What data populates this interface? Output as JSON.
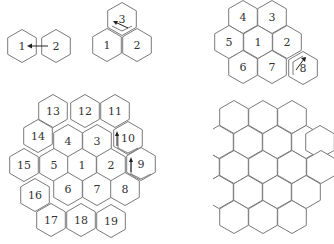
{
  "panels": [
    {
      "id": "panel-a",
      "hexes": [
        {
          "label": "1",
          "cx": 22,
          "cy": 46
        },
        {
          "label": "2",
          "cx": 56,
          "cy": 46
        }
      ],
      "arrow": {
        "from": "2",
        "to": "1"
      }
    },
    {
      "id": "panel-b",
      "hexes": [
        {
          "label": "3",
          "cx": 122,
          "cy": 19
        },
        {
          "label": "1",
          "cx": 107,
          "cy": 45
        },
        {
          "label": "2",
          "cx": 137,
          "cy": 45
        }
      ],
      "arrow": {
        "from": "3",
        "to": "1"
      }
    },
    {
      "id": "panel-c",
      "hexes": [
        {
          "label": "4",
          "cx": 243,
          "cy": 17
        },
        {
          "label": "3",
          "cx": 272,
          "cy": 17
        },
        {
          "label": "5",
          "cx": 229,
          "cy": 42
        },
        {
          "label": "1",
          "cx": 258,
          "cy": 42
        },
        {
          "label": "2",
          "cx": 287,
          "cy": 42
        },
        {
          "label": "6",
          "cx": 243,
          "cy": 67
        },
        {
          "label": "7",
          "cx": 272,
          "cy": 67
        },
        {
          "label": "8",
          "cx": 303,
          "cy": 68
        }
      ],
      "arrow": {
        "from": "8",
        "to": "7"
      }
    },
    {
      "id": "panel-d",
      "hexes": [
        {
          "label": "13",
          "cx": 53,
          "cy": 111
        },
        {
          "label": "12",
          "cx": 85,
          "cy": 111
        },
        {
          "label": "11",
          "cx": 115,
          "cy": 111
        },
        {
          "label": "14",
          "cx": 38,
          "cy": 136
        },
        {
          "label": "4",
          "cx": 68,
          "cy": 141
        },
        {
          "label": "3",
          "cx": 97,
          "cy": 141
        },
        {
          "label": "10",
          "cx": 128,
          "cy": 138
        },
        {
          "label": "15",
          "cx": 24,
          "cy": 165
        },
        {
          "label": "5",
          "cx": 54,
          "cy": 165
        },
        {
          "label": "1",
          "cx": 82,
          "cy": 165
        },
        {
          "label": "2",
          "cx": 111,
          "cy": 165
        },
        {
          "label": "9",
          "cx": 141,
          "cy": 164
        },
        {
          "label": "16",
          "cx": 35,
          "cy": 195
        },
        {
          "label": "6",
          "cx": 68,
          "cy": 189
        },
        {
          "label": "7",
          "cx": 97,
          "cy": 189
        },
        {
          "label": "8",
          "cx": 125,
          "cy": 189
        },
        {
          "label": "17",
          "cx": 51,
          "cy": 220
        },
        {
          "label": "18",
          "cx": 81,
          "cy": 220
        },
        {
          "label": "19",
          "cx": 111,
          "cy": 221
        }
      ]
    },
    {
      "id": "panel-e",
      "note": "unlabeled hexagonal tiling",
      "rows": [
        {
          "cy": 117,
          "cx": [
            234,
            263,
            292
          ]
        },
        {
          "cy": 142,
          "cx": [
            205,
            219,
            248,
            277,
            306,
            320
          ]
        },
        {
          "cy": 167,
          "cx": [
            205,
            234,
            263,
            292,
            321
          ]
        },
        {
          "cy": 192,
          "cx": [
            219,
            248,
            277,
            306
          ]
        },
        {
          "cy": 217,
          "cx": [
            234,
            263,
            292
          ]
        }
      ]
    }
  ]
}
